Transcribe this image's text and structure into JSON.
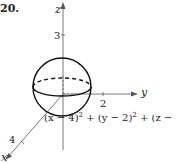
{
  "problem_number": "20.",
  "axes": {
    "x": {
      "label": "x",
      "tick_label": "4"
    },
    "y": {
      "label": "y",
      "tick_label": "2"
    },
    "z": {
      "label": "z",
      "tick_label": "3"
    }
  },
  "sphere": {
    "center": [
      4,
      2,
      3
    ],
    "radius": 1
  },
  "equation": {
    "t1": "(x − 4)",
    "t2": " + (y − 2)",
    "t3": " + (z − 3)",
    "rhs": " = 1",
    "exp": "2"
  },
  "colors": {
    "stroke": "#222222",
    "axis": "#555555"
  }
}
